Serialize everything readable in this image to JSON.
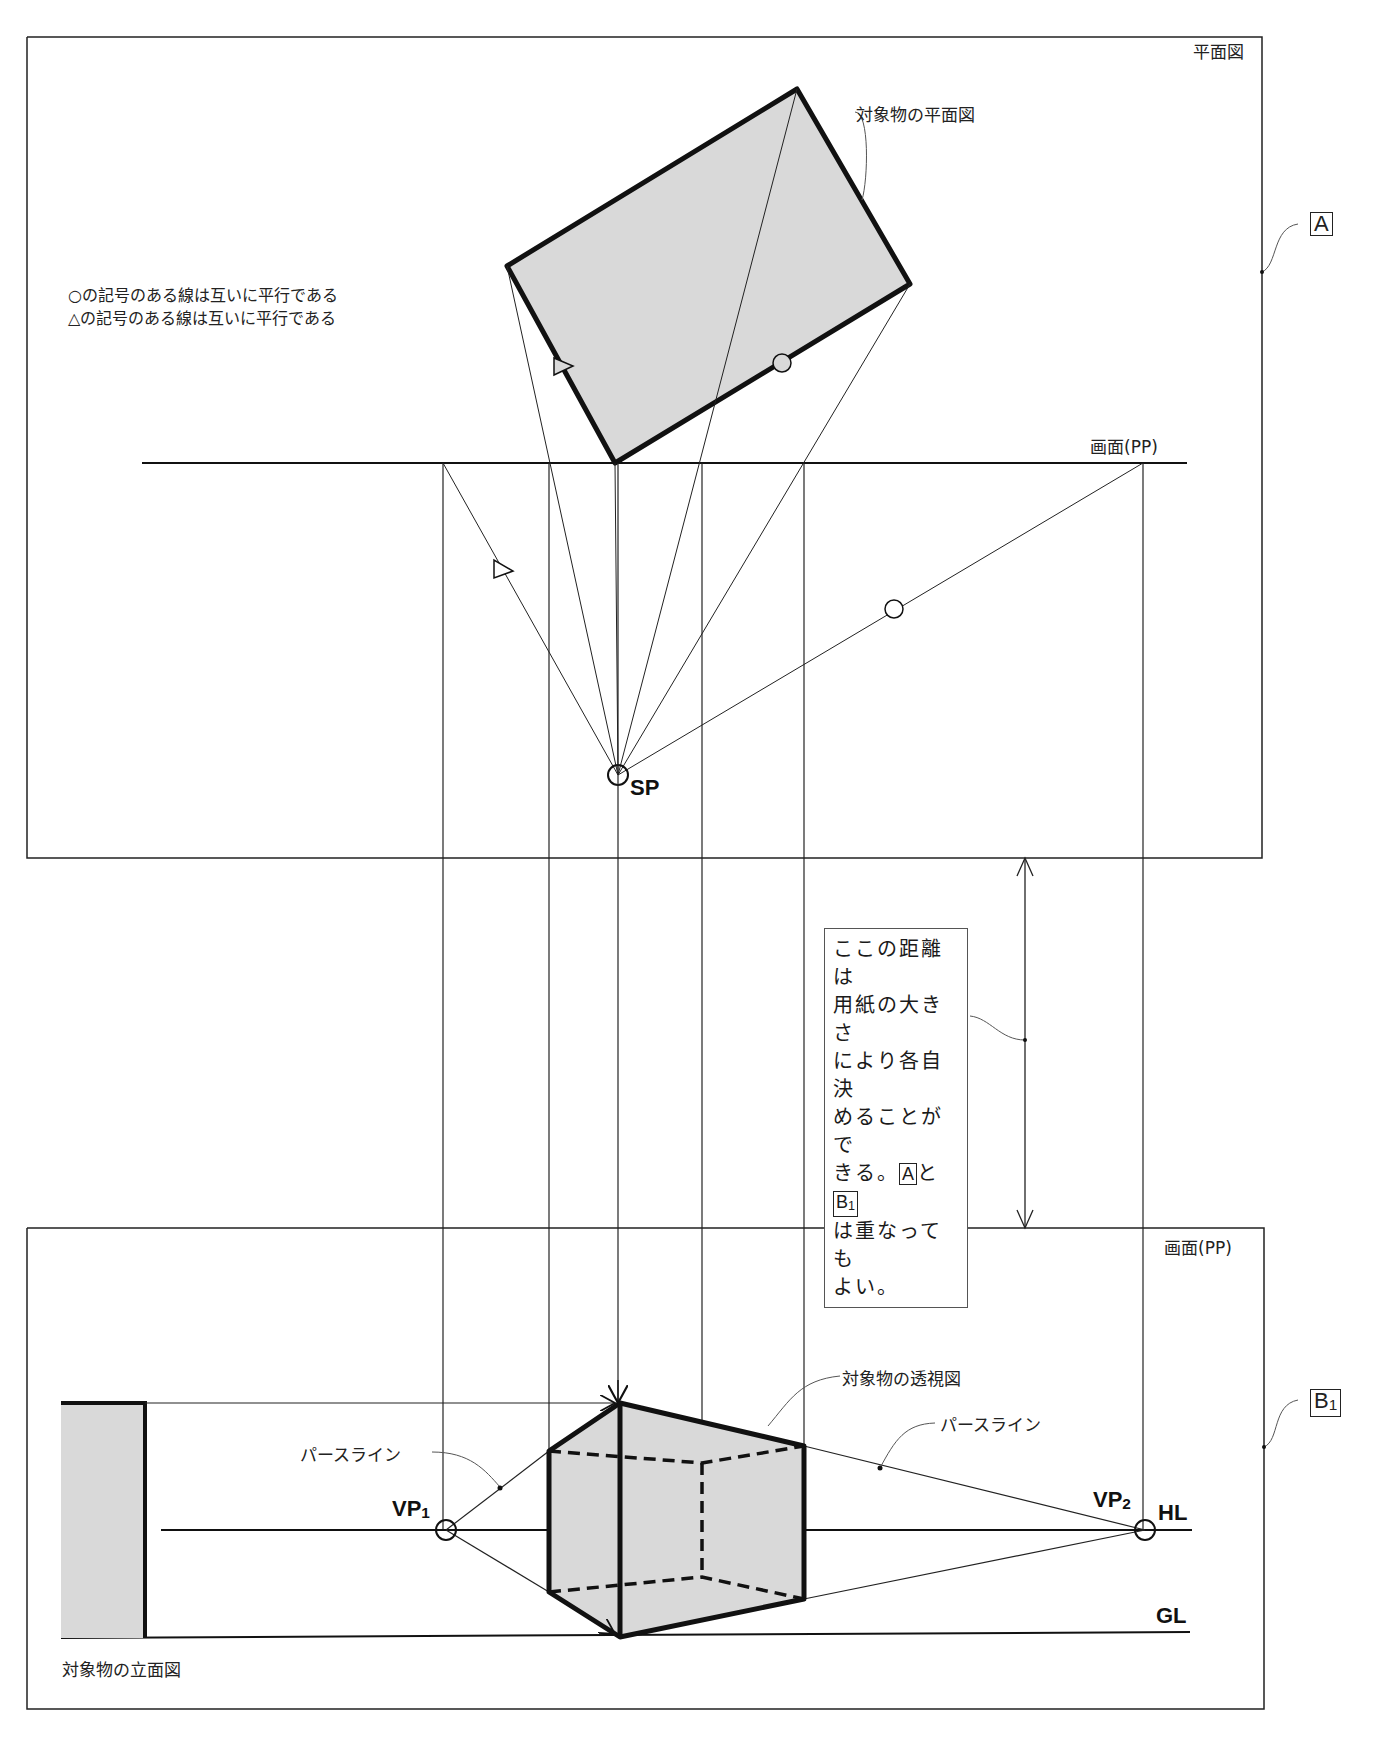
{
  "plan_view": {
    "frame_title": "平面図",
    "frame_tag": "A",
    "object_label": "対象物の平面図",
    "picture_plane_label": "画面(PP)",
    "station_point_label": "SP",
    "notes": [
      "○の記号のある線は互いに平行である",
      "△の記号のある線は互いに平行である"
    ]
  },
  "spacing_note": {
    "lines": [
      "ここの距離は",
      "用紙の大きさ",
      "により各自決",
      "めることがで"
    ],
    "line5_prefix": "きる。",
    "tag_a": "A",
    "line5_mid": "と",
    "tag_b": "B",
    "tag_b_sub": "1",
    "line6": "は重なっても",
    "line7": "よい。"
  },
  "perspective_view": {
    "frame_tag": "B",
    "frame_tag_sub": "1",
    "picture_plane_label": "画面(PP)",
    "object_label": "対象物の透視図",
    "elevation_label": "対象物の立面図",
    "perspective_line_label_left": "パースライン",
    "perspective_line_label_right": "パースライン",
    "vp1": "VP",
    "vp1_sub": "1",
    "vp2": "VP",
    "vp2_sub": "2",
    "horizon_line": "HL",
    "ground_line": "GL"
  },
  "colors": {
    "ink": "#111111",
    "fill": "#d9d9d9",
    "thin": "#333333"
  }
}
